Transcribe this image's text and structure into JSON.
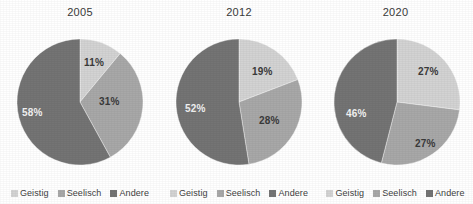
{
  "chart_data": [
    {
      "type": "pie",
      "title": "2005",
      "categories": [
        "Geistig",
        "Seelisch",
        "Andere"
      ],
      "values": [
        11,
        31,
        58
      ],
      "labels": [
        "11%",
        "31%",
        "58%"
      ],
      "colors": [
        "#d3d3d3",
        "#a8a8a8",
        "#747474"
      ],
      "legend_position": "bottom",
      "start_angle_deg": 0,
      "direction": "clockwise"
    },
    {
      "type": "pie",
      "title": "2012",
      "categories": [
        "Geistig",
        "Seelisch",
        "Andere"
      ],
      "values": [
        19,
        28,
        52
      ],
      "labels": [
        "19%",
        "28%",
        "52%"
      ],
      "colors": [
        "#d3d3d3",
        "#a8a8a8",
        "#747474"
      ],
      "legend_position": "bottom",
      "start_angle_deg": 0,
      "direction": "clockwise"
    },
    {
      "type": "pie",
      "title": "2020",
      "categories": [
        "Geistig",
        "Seelisch",
        "Andere"
      ],
      "values": [
        27,
        27,
        46
      ],
      "labels": [
        "27%",
        "27%",
        "46%"
      ],
      "colors": [
        "#d3d3d3",
        "#a8a8a8",
        "#747474"
      ],
      "legend_position": "bottom",
      "start_angle_deg": 0,
      "direction": "clockwise"
    }
  ],
  "panels": [
    {
      "title": "2005",
      "slice_labels": {
        "geistig": "11%",
        "seelisch": "31%",
        "andere": "58%"
      },
      "legend": [
        {
          "label": "Geistig",
          "color": "#d3d3d3"
        },
        {
          "label": "Seelisch",
          "color": "#a8a8a8"
        },
        {
          "label": "Andere",
          "color": "#747474"
        }
      ]
    },
    {
      "title": "2012",
      "slice_labels": {
        "geistig": "19%",
        "seelisch": "28%",
        "andere": "52%"
      },
      "legend": [
        {
          "label": "Geistig",
          "color": "#d3d3d3"
        },
        {
          "label": "Seelisch",
          "color": "#a8a8a8"
        },
        {
          "label": "Andere",
          "color": "#747474"
        }
      ]
    },
    {
      "title": "2020",
      "slice_labels": {
        "geistig": "27%",
        "seelisch": "27%",
        "andere": "46%"
      },
      "legend": [
        {
          "label": "Geistig",
          "color": "#d3d3d3"
        },
        {
          "label": "Seelisch",
          "color": "#a8a8a8"
        },
        {
          "label": "Andere",
          "color": "#747474"
        }
      ]
    }
  ],
  "palette": {
    "geistig": "#d3d3d3",
    "seelisch": "#a8a8a8",
    "andere": "#747474",
    "background": "#ffffff",
    "text": "#3a3a3a",
    "text_on_dark": "#f2f2f2"
  }
}
